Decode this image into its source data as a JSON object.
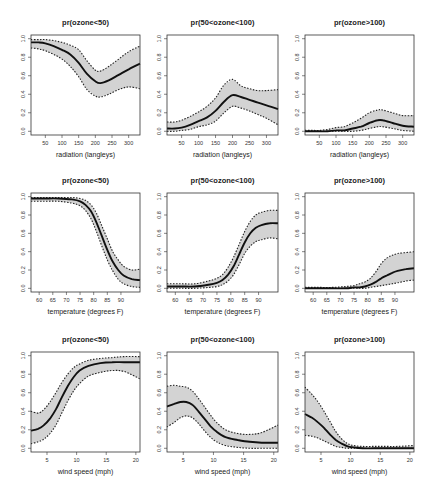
{
  "chart_data": [
    {
      "type": "line",
      "row": 0,
      "col": 0,
      "title": "pr(ozone<50)",
      "xlabel": "radiation (langleys)",
      "ylabel": "",
      "xlim": [
        7,
        334
      ],
      "ylim": [
        -0.04,
        1.04
      ],
      "xticks": [
        50,
        100,
        150,
        200,
        250,
        300
      ],
      "yticks": [
        0.0,
        0.2,
        0.4,
        0.6,
        0.8,
        1.0
      ],
      "x": [
        7,
        30,
        50,
        75,
        100,
        125,
        150,
        175,
        200,
        215,
        240,
        270,
        300,
        334
      ],
      "fit": [
        0.96,
        0.96,
        0.95,
        0.92,
        0.88,
        0.83,
        0.74,
        0.62,
        0.54,
        0.52,
        0.55,
        0.61,
        0.67,
        0.73
      ],
      "lower": [
        0.9,
        0.89,
        0.87,
        0.83,
        0.78,
        0.7,
        0.59,
        0.45,
        0.38,
        0.37,
        0.4,
        0.45,
        0.48,
        0.46
      ],
      "upper": [
        0.99,
        0.99,
        0.99,
        0.98,
        0.96,
        0.93,
        0.88,
        0.76,
        0.66,
        0.65,
        0.7,
        0.78,
        0.86,
        0.92
      ]
    },
    {
      "type": "line",
      "row": 0,
      "col": 1,
      "title": "pr(50<ozone<100)",
      "xlabel": "radiation (langleys)",
      "ylabel": "",
      "xlim": [
        7,
        334
      ],
      "ylim": [
        -0.04,
        1.04
      ],
      "xticks": [
        50,
        100,
        150,
        200,
        250,
        300
      ],
      "yticks": [
        0.0,
        0.2,
        0.4,
        0.6,
        0.8,
        1.0
      ],
      "x": [
        7,
        30,
        50,
        75,
        100,
        125,
        150,
        175,
        200,
        225,
        250,
        275,
        300,
        334
      ],
      "fit": [
        0.03,
        0.03,
        0.04,
        0.07,
        0.11,
        0.15,
        0.22,
        0.32,
        0.39,
        0.37,
        0.34,
        0.31,
        0.28,
        0.24
      ],
      "lower": [
        0.0,
        0.0,
        0.01,
        0.02,
        0.05,
        0.07,
        0.11,
        0.2,
        0.27,
        0.25,
        0.22,
        0.18,
        0.14,
        0.07
      ],
      "upper": [
        0.1,
        0.1,
        0.12,
        0.16,
        0.21,
        0.27,
        0.36,
        0.5,
        0.56,
        0.49,
        0.46,
        0.44,
        0.44,
        0.45
      ]
    },
    {
      "type": "line",
      "row": 0,
      "col": 2,
      "title": "pr(ozone>100)",
      "xlabel": "radiation (langleys)",
      "ylabel": "",
      "xlim": [
        7,
        334
      ],
      "ylim": [
        -0.04,
        1.04
      ],
      "xticks": [
        50,
        100,
        150,
        200,
        250,
        300
      ],
      "yticks": [
        0.0,
        0.2,
        0.4,
        0.6,
        0.8,
        1.0
      ],
      "x": [
        7,
        30,
        50,
        75,
        100,
        125,
        150,
        175,
        200,
        225,
        240,
        270,
        300,
        334
      ],
      "fit": [
        0.0,
        0.0,
        0.0,
        0.0,
        0.01,
        0.01,
        0.03,
        0.05,
        0.09,
        0.12,
        0.12,
        0.09,
        0.06,
        0.05
      ],
      "lower": [
        0.0,
        0.0,
        0.0,
        0.0,
        0.0,
        0.0,
        0.0,
        0.01,
        0.03,
        0.05,
        0.05,
        0.03,
        0.01,
        0.0
      ],
      "upper": [
        0.01,
        0.01,
        0.01,
        0.02,
        0.04,
        0.05,
        0.09,
        0.14,
        0.2,
        0.23,
        0.23,
        0.2,
        0.17,
        0.17
      ]
    },
    {
      "type": "line",
      "row": 1,
      "col": 0,
      "title": "pr(ozone<50)",
      "xlabel": "temperature (degrees F)",
      "ylabel": "",
      "xlim": [
        57,
        97
      ],
      "ylim": [
        -0.04,
        1.04
      ],
      "xticks": [
        60,
        65,
        70,
        75,
        80,
        85,
        90
      ],
      "yticks": [
        0.0,
        0.2,
        0.4,
        0.6,
        0.8,
        1.0
      ],
      "x": [
        57,
        62,
        67,
        72,
        75,
        77,
        79,
        81,
        83,
        85,
        87,
        89,
        91,
        94,
        97
      ],
      "fit": [
        0.98,
        0.98,
        0.98,
        0.97,
        0.95,
        0.91,
        0.84,
        0.72,
        0.57,
        0.42,
        0.29,
        0.2,
        0.14,
        0.1,
        0.09
      ],
      "lower": [
        0.95,
        0.95,
        0.95,
        0.93,
        0.9,
        0.85,
        0.76,
        0.62,
        0.46,
        0.31,
        0.19,
        0.1,
        0.05,
        0.02,
        0.01
      ],
      "upper": [
        0.99,
        0.99,
        0.99,
        0.99,
        0.98,
        0.96,
        0.91,
        0.82,
        0.68,
        0.54,
        0.4,
        0.31,
        0.24,
        0.2,
        0.21
      ]
    },
    {
      "type": "line",
      "row": 1,
      "col": 1,
      "title": "pr(50<ozone<100)",
      "xlabel": "temperature (degrees F)",
      "ylabel": "",
      "xlim": [
        57,
        97
      ],
      "ylim": [
        -0.04,
        1.04
      ],
      "xticks": [
        60,
        65,
        70,
        75,
        80,
        85,
        90
      ],
      "yticks": [
        0.0,
        0.2,
        0.4,
        0.6,
        0.8,
        1.0
      ],
      "x": [
        57,
        62,
        67,
        72,
        75,
        77,
        79,
        81,
        83,
        85,
        87,
        89,
        91,
        94,
        97
      ],
      "fit": [
        0.02,
        0.02,
        0.02,
        0.04,
        0.06,
        0.09,
        0.15,
        0.24,
        0.37,
        0.5,
        0.6,
        0.66,
        0.69,
        0.71,
        0.71
      ],
      "lower": [
        0.0,
        0.0,
        0.0,
        0.01,
        0.02,
        0.04,
        0.08,
        0.15,
        0.26,
        0.38,
        0.46,
        0.51,
        0.53,
        0.55,
        0.54
      ],
      "upper": [
        0.05,
        0.05,
        0.05,
        0.08,
        0.11,
        0.15,
        0.23,
        0.34,
        0.48,
        0.62,
        0.73,
        0.8,
        0.83,
        0.85,
        0.85
      ]
    },
    {
      "type": "line",
      "row": 1,
      "col": 2,
      "title": "pr(ozone>100)",
      "xlabel": "temperature (degrees F)",
      "ylabel": "",
      "xlim": [
        57,
        97
      ],
      "ylim": [
        -0.04,
        1.04
      ],
      "xticks": [
        60,
        65,
        70,
        75,
        80,
        85,
        90
      ],
      "yticks": [
        0.0,
        0.2,
        0.4,
        0.6,
        0.8,
        1.0
      ],
      "x": [
        57,
        62,
        67,
        72,
        75,
        77,
        79,
        81,
        83,
        85,
        87,
        89,
        91,
        94,
        97
      ],
      "fit": [
        0.0,
        0.0,
        0.0,
        0.0,
        0.01,
        0.01,
        0.02,
        0.04,
        0.07,
        0.11,
        0.14,
        0.17,
        0.19,
        0.21,
        0.22
      ],
      "lower": [
        0.0,
        0.0,
        0.0,
        0.0,
        0.0,
        0.0,
        0.0,
        0.01,
        0.02,
        0.03,
        0.04,
        0.05,
        0.06,
        0.08,
        0.09
      ],
      "upper": [
        0.01,
        0.01,
        0.01,
        0.02,
        0.03,
        0.05,
        0.07,
        0.11,
        0.18,
        0.27,
        0.33,
        0.36,
        0.38,
        0.39,
        0.4
      ]
    },
    {
      "type": "line",
      "row": 2,
      "col": 0,
      "title": "pr(ozone<50)",
      "xlabel": "wind speed (mph)",
      "ylabel": "",
      "xlim": [
        2.3,
        20.7
      ],
      "ylim": [
        -0.04,
        1.04
      ],
      "xticks": [
        5,
        10,
        15,
        20
      ],
      "yticks": [
        0.0,
        0.2,
        0.4,
        0.6,
        0.8,
        1.0
      ],
      "x": [
        2.3,
        3.5,
        4.5,
        5.5,
        6.5,
        7.5,
        8.5,
        9.5,
        10.5,
        12,
        14,
        16,
        18,
        20.7
      ],
      "fit": [
        0.19,
        0.21,
        0.25,
        0.32,
        0.42,
        0.55,
        0.67,
        0.77,
        0.84,
        0.89,
        0.92,
        0.93,
        0.93,
        0.93
      ],
      "lower": [
        0.05,
        0.07,
        0.1,
        0.16,
        0.25,
        0.38,
        0.51,
        0.62,
        0.7,
        0.78,
        0.82,
        0.84,
        0.83,
        0.75
      ],
      "upper": [
        0.4,
        0.38,
        0.42,
        0.5,
        0.6,
        0.71,
        0.8,
        0.87,
        0.91,
        0.95,
        0.97,
        0.98,
        0.99,
        0.99
      ]
    },
    {
      "type": "line",
      "row": 2,
      "col": 1,
      "title": "pr(50<ozone<100)",
      "xlabel": "wind speed (mph)",
      "ylabel": "",
      "xlim": [
        2.3,
        20.7
      ],
      "ylim": [
        -0.04,
        1.04
      ],
      "xticks": [
        5,
        10,
        15,
        20
      ],
      "yticks": [
        0.0,
        0.2,
        0.4,
        0.6,
        0.8,
        1.0
      ],
      "x": [
        2.3,
        3.5,
        4.5,
        5.5,
        6.5,
        7.5,
        8.5,
        9.5,
        10.5,
        12,
        14,
        16,
        18,
        20.7
      ],
      "fit": [
        0.45,
        0.48,
        0.5,
        0.5,
        0.47,
        0.4,
        0.32,
        0.24,
        0.18,
        0.12,
        0.09,
        0.07,
        0.06,
        0.06
      ],
      "lower": [
        0.23,
        0.28,
        0.33,
        0.35,
        0.33,
        0.27,
        0.19,
        0.12,
        0.07,
        0.03,
        0.01,
        0.0,
        0.0,
        0.0
      ],
      "upper": [
        0.67,
        0.68,
        0.67,
        0.66,
        0.62,
        0.54,
        0.45,
        0.36,
        0.28,
        0.2,
        0.16,
        0.15,
        0.17,
        0.25
      ]
    },
    {
      "type": "line",
      "row": 2,
      "col": 2,
      "title": "pr(ozone>100)",
      "xlabel": "wind speed (mph)",
      "ylabel": "",
      "xlim": [
        2.3,
        20.7
      ],
      "ylim": [
        -0.04,
        1.04
      ],
      "xticks": [
        5,
        10,
        15,
        20
      ],
      "yticks": [
        0.0,
        0.2,
        0.4,
        0.6,
        0.8,
        1.0
      ],
      "x": [
        2.3,
        3.5,
        4.5,
        5.5,
        6.5,
        7.5,
        8.5,
        9.5,
        10.5,
        12,
        14,
        16,
        18,
        20.7
      ],
      "fit": [
        0.37,
        0.33,
        0.28,
        0.22,
        0.15,
        0.09,
        0.05,
        0.02,
        0.01,
        0.0,
        0.0,
        0.0,
        0.0,
        0.0
      ],
      "lower": [
        0.14,
        0.13,
        0.11,
        0.08,
        0.05,
        0.02,
        0.01,
        0.0,
        0.0,
        0.0,
        0.0,
        0.0,
        0.0,
        0.0
      ],
      "upper": [
        0.66,
        0.58,
        0.5,
        0.4,
        0.29,
        0.18,
        0.1,
        0.05,
        0.03,
        0.02,
        0.02,
        0.02,
        0.02,
        0.03
      ]
    }
  ],
  "layout": {
    "cols_x": [
      [
        31,
        140
      ],
      [
        167,
        278
      ],
      [
        305,
        414
      ]
    ],
    "rows_y": [
      [
        35,
        135
      ],
      [
        193,
        292
      ],
      [
        352,
        452
      ]
    ]
  }
}
